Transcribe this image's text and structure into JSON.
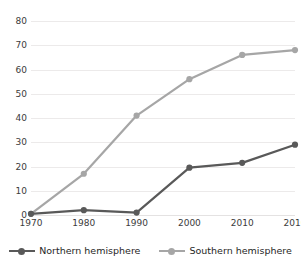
{
  "chart_data": {
    "type": "line",
    "title": "",
    "xlabel": "",
    "ylabel": "",
    "categories": [
      "1970",
      "1980",
      "1990",
      "2000",
      "2010",
      "2016"
    ],
    "x": [
      1970,
      1980,
      1990,
      2000,
      2010,
      2016
    ],
    "ylim": [
      0,
      80
    ],
    "ytick_step": 10,
    "yticks": [
      "0",
      "10",
      "20",
      "30",
      "40",
      "50",
      "60",
      "70",
      "80"
    ],
    "grid": true,
    "legend_position": "bottom",
    "series": [
      {
        "name": "Northern hemisphere",
        "color": "#595959",
        "marker": "circle",
        "values": [
          0.5,
          2,
          1,
          19.5,
          21.5,
          29
        ]
      },
      {
        "name": "Southern hemisphere",
        "color": "#a6a6a6",
        "marker": "circle",
        "values": [
          0.5,
          17,
          41,
          56,
          66,
          68
        ]
      }
    ]
  },
  "legend": {
    "items": [
      {
        "label": "Northern hemisphere",
        "color": "#595959"
      },
      {
        "label": "Southern hemisphere",
        "color": "#a6a6a6"
      }
    ]
  }
}
